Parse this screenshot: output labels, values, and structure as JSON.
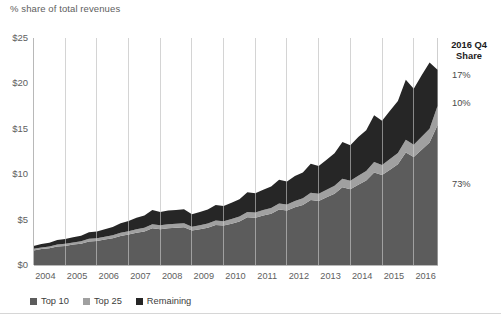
{
  "header": {
    "axis_note": "% share of total revenues"
  },
  "annotation": {
    "title_line1": "2016 Q4",
    "title_line2": "Share",
    "remaining_pct": "17%",
    "top25_pct": "10%",
    "top10_pct": "73%"
  },
  "legend": {
    "position": "bottom-left",
    "items": [
      {
        "label": "Top 10",
        "color": "#5c5c5c"
      },
      {
        "label": "Top 25",
        "color": "#a0a0a0"
      },
      {
        "label": "Remaining",
        "color": "#262626"
      }
    ]
  },
  "colors": {
    "top10": "#5c5c5c",
    "top25": "#a0a0a0",
    "remaining": "#262626",
    "axis": "#b8b8b8",
    "gridline": "#cfcfcf",
    "text": "#5e5e5e",
    "rule": "#d6d6d6"
  },
  "chart_data": {
    "type": "area",
    "title": "",
    "subtitle": "",
    "xlabel": "",
    "ylabel": "% share of total revenues",
    "ylim": [
      0,
      25
    ],
    "yticks": [
      "$0",
      "$5",
      "$10",
      "$15",
      "$20",
      "$25"
    ],
    "ytick_values": [
      0,
      5,
      10,
      15,
      20,
      25
    ],
    "grid": "vertical-only",
    "stacked": true,
    "x": [
      "2004 Q1",
      "2004 Q2",
      "2004 Q3",
      "2004 Q4",
      "2005 Q1",
      "2005 Q2",
      "2005 Q3",
      "2005 Q4",
      "2006 Q1",
      "2006 Q2",
      "2006 Q3",
      "2006 Q4",
      "2007 Q1",
      "2007 Q2",
      "2007 Q3",
      "2007 Q4",
      "2008 Q1",
      "2008 Q2",
      "2008 Q3",
      "2008 Q4",
      "2009 Q1",
      "2009 Q2",
      "2009 Q3",
      "2009 Q4",
      "2010 Q1",
      "2010 Q2",
      "2010 Q3",
      "2010 Q4",
      "2011 Q1",
      "2011 Q2",
      "2011 Q3",
      "2011 Q4",
      "2012 Q1",
      "2012 Q2",
      "2012 Q3",
      "2012 Q4",
      "2013 Q1",
      "2013 Q2",
      "2013 Q3",
      "2013 Q4",
      "2014 Q1",
      "2014 Q2",
      "2014 Q3",
      "2014 Q4",
      "2015 Q1",
      "2015 Q2",
      "2015 Q3",
      "2015 Q4",
      "2016 Q1",
      "2016 Q2",
      "2016 Q3",
      "2016 Q4"
    ],
    "xtick_labels": [
      "2004",
      "2005",
      "2006",
      "2007",
      "2008",
      "2009",
      "2010",
      "2011",
      "2012",
      "2013",
      "2014",
      "2015",
      "2016"
    ],
    "series": [
      {
        "name": "Top 10",
        "color": "#5c5c5c",
        "values": [
          1.6,
          1.75,
          1.85,
          2.05,
          2.1,
          2.25,
          2.35,
          2.6,
          2.65,
          2.8,
          2.95,
          3.2,
          3.35,
          3.55,
          3.7,
          4.05,
          3.95,
          4.05,
          4.1,
          4.15,
          3.8,
          3.95,
          4.1,
          4.4,
          4.35,
          4.55,
          4.8,
          5.25,
          5.2,
          5.45,
          5.65,
          6.1,
          6.0,
          6.35,
          6.6,
          7.15,
          7.05,
          7.45,
          7.85,
          8.55,
          8.35,
          8.85,
          9.3,
          10.2,
          9.9,
          10.5,
          11.1,
          12.4,
          11.9,
          12.7,
          13.5,
          15.4
        ]
      },
      {
        "name": "Top 25",
        "color": "#a0a0a0",
        "values": [
          0.18,
          0.19,
          0.2,
          0.22,
          0.23,
          0.24,
          0.26,
          0.28,
          0.29,
          0.31,
          0.32,
          0.35,
          0.37,
          0.39,
          0.41,
          0.45,
          0.44,
          0.45,
          0.45,
          0.46,
          0.42,
          0.44,
          0.46,
          0.49,
          0.48,
          0.51,
          0.53,
          0.58,
          0.58,
          0.61,
          0.63,
          0.68,
          0.67,
          0.71,
          0.74,
          0.8,
          0.79,
          0.83,
          0.88,
          0.96,
          0.94,
          0.99,
          1.04,
          1.14,
          1.11,
          1.18,
          1.24,
          1.39,
          1.33,
          1.42,
          1.51,
          2.1
        ]
      },
      {
        "name": "Remaining",
        "color": "#262626",
        "values": [
          0.32,
          0.36,
          0.4,
          0.48,
          0.52,
          0.56,
          0.62,
          0.72,
          0.76,
          0.84,
          0.92,
          1.05,
          1.13,
          1.26,
          1.34,
          1.55,
          1.46,
          1.5,
          1.5,
          1.54,
          1.38,
          1.46,
          1.54,
          1.71,
          1.67,
          1.79,
          1.92,
          2.17,
          2.12,
          2.24,
          2.37,
          2.62,
          2.53,
          2.74,
          2.86,
          3.2,
          3.06,
          3.32,
          3.57,
          4.04,
          3.91,
          4.26,
          4.51,
          5.16,
          4.89,
          5.32,
          5.71,
          6.61,
          6.17,
          6.78,
          7.29,
          4.0
        ]
      }
    ]
  }
}
